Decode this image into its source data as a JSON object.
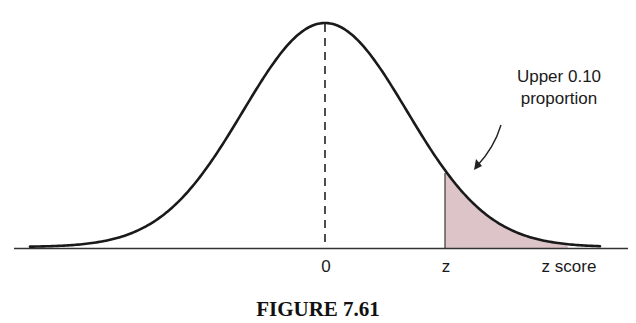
{
  "figure": {
    "caption": "FIGURE 7.61",
    "annotation_line1": "Upper 0.10",
    "annotation_line2": "proportion",
    "tick_zero": "0",
    "tick_z": "z",
    "axis_label": "z score"
  },
  "colors": {
    "curve": "#1a1a1a",
    "shade": "#dcc4c8",
    "axis": "#333333"
  },
  "chart_data": {
    "type": "area",
    "title": "FIGURE 7.61",
    "xlabel": "z score",
    "ylabel": "",
    "x_ticks": [
      "0",
      "z"
    ],
    "mean": 0,
    "sd": 1,
    "shaded_region": {
      "from": "z",
      "to": "+inf",
      "proportion": 0.1,
      "z_value_implied": 1.28
    },
    "annotations": [
      {
        "text": "Upper 0.10 proportion",
        "points_to": "shaded upper tail"
      }
    ],
    "reference_lines": [
      {
        "x": 0,
        "style": "dashed",
        "label": "0"
      }
    ],
    "grid": false,
    "legend": "none"
  }
}
